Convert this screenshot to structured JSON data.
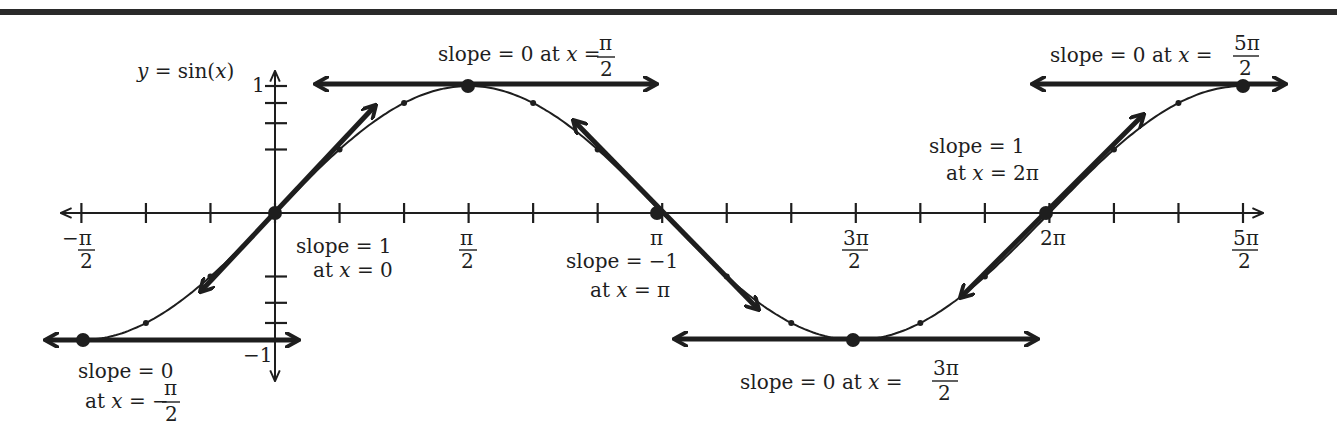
{
  "title": "y = sin(x)",
  "colors": {
    "ink": "#1e1e1e",
    "background": "#ffffff",
    "rule": "#2a2a2a"
  },
  "axes": {
    "x_tick_labels": [
      {
        "num": "−π",
        "den": "2",
        "value": "-pi/2"
      },
      {
        "num": "π",
        "den": "2",
        "value": "pi/2"
      },
      {
        "num": "π",
        "den": "",
        "value": "pi"
      },
      {
        "num": "3π",
        "den": "2",
        "value": "3pi/2"
      },
      {
        "num": "2π",
        "den": "",
        "value": "2pi"
      },
      {
        "num": "5π",
        "den": "2",
        "value": "5pi/2"
      }
    ],
    "y_tick_labels": [
      {
        "label": "1",
        "value": 1
      },
      {
        "label": "−1",
        "value": -1
      }
    ]
  },
  "annotations": {
    "a0": {
      "line1": "slope = 0",
      "line2_prefix": "at ",
      "line2_var": "x",
      "line2_eq": " = −",
      "frac_num": "π",
      "frac_den": "2"
    },
    "a1": {
      "line1": "slope = 1",
      "line2_prefix": "at ",
      "line2_var": "x",
      "line2_eq": " = 0"
    },
    "a2": {
      "prefix": "slope = 0 at ",
      "var": "x",
      "eq": " = ",
      "frac_num": "π",
      "frac_den": "2"
    },
    "a3": {
      "line1": "slope = −1",
      "line2_prefix": "at ",
      "line2_var": "x",
      "line2_eq": " = π"
    },
    "a4": {
      "prefix": "slope = 0   at ",
      "var": "x",
      "eq": " = ",
      "frac_num": "3π",
      "frac_den": "2"
    },
    "a5": {
      "line1": "slope = 1",
      "line2_prefix": "at ",
      "line2_var": "x",
      "line2_eq": " = 2π"
    },
    "a6": {
      "prefix": "slope = 0  at ",
      "var": "x",
      "eq": " = ",
      "frac_num": "5π",
      "frac_den": "2"
    }
  },
  "chart_data": {
    "type": "line",
    "title": "y = sin(x)",
    "xlabel": "x",
    "ylabel": "y",
    "xlim": [
      -1.5708,
      7.854
    ],
    "ylim": [
      -1,
      1
    ],
    "x_ticks": [
      "-π/2",
      "π/2",
      "π",
      "3π/2",
      "2π",
      "5π/2"
    ],
    "y_ticks": [
      "1",
      "-1"
    ],
    "series": [
      {
        "name": "sin(x)",
        "function": "sin(x)"
      }
    ],
    "tangent_lines": [
      {
        "x": "-π/2",
        "y": -1,
        "slope": 0
      },
      {
        "x": "0",
        "y": 0,
        "slope": 1
      },
      {
        "x": "π/2",
        "y": 1,
        "slope": 0
      },
      {
        "x": "π",
        "y": 0,
        "slope": -1
      },
      {
        "x": "3π/2",
        "y": -1,
        "slope": 0
      },
      {
        "x": "2π",
        "y": 0,
        "slope": 1
      },
      {
        "x": "5π/2",
        "y": 1,
        "slope": 0
      }
    ],
    "grid": false
  }
}
